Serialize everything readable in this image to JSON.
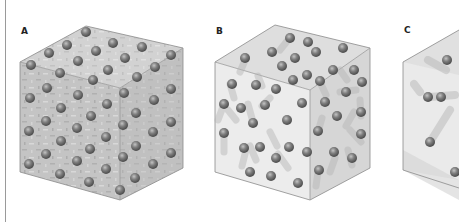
{
  "figure": {
    "panels": [
      {
        "label": "A",
        "state": "solid",
        "description": "Particles in ordered lattice, vibrating in place"
      },
      {
        "label": "B",
        "state": "liquid",
        "description": "Particles close together, moving with short trails"
      },
      {
        "label": "C",
        "state": "gas",
        "description": "Few particles far apart, moving with long trails"
      }
    ]
  },
  "colors": {
    "particle": "#6e6e6e",
    "particle_highlight": "#b8b8b8",
    "cube_edge": "#8a8a8a",
    "face_solid": "#c9c9c9",
    "face_liquid": "#e6e6e6",
    "face_gas": "#ececec"
  }
}
